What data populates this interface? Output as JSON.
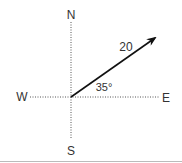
{
  "diagram": {
    "directions": {
      "north": "N",
      "south": "S",
      "west": "W",
      "east": "E"
    },
    "vector": {
      "magnitude_label": "20",
      "angle_label": "35°"
    },
    "colors": {
      "axis": "#555555",
      "vector": "#111111",
      "text": "#333333",
      "border": "#bbbbbb"
    }
  }
}
